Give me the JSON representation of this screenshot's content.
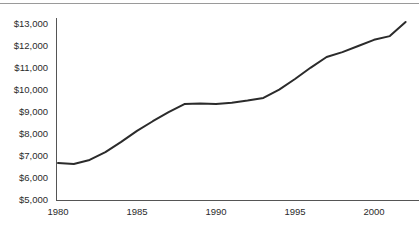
{
  "chart_data": {
    "type": "line",
    "title": "",
    "subtitle": "",
    "xlabel": "",
    "ylabel": "",
    "xlim": [
      1980,
      2002
    ],
    "ylim": [
      5000,
      13000
    ],
    "grid": false,
    "legend": null,
    "legend_position": "none",
    "y_tick_labels": [
      "$13,000",
      "$12,000",
      "$11,000",
      "$10,000",
      "$9,000",
      "$8,000",
      "$7,000",
      "$6,000",
      "$5,000"
    ],
    "y_tick_values": [
      13000,
      12000,
      11000,
      10000,
      9000,
      8000,
      7000,
      6000,
      5000
    ],
    "x_tick_labels": [
      "1980",
      "1985",
      "1990",
      "1995",
      "2000"
    ],
    "x_tick_values": [
      1980,
      1985,
      1990,
      1995,
      2000
    ],
    "series": [
      {
        "name": "value",
        "color": "#2b2b2b",
        "x": [
          1980,
          1981,
          1982,
          1983,
          1984,
          1985,
          1986,
          1987,
          1988,
          1989,
          1990,
          1991,
          1992,
          1993,
          1994,
          1995,
          1996,
          1997,
          1998,
          1999,
          2000,
          2001,
          2002
        ],
        "values": [
          6680,
          6640,
          6820,
          7180,
          7640,
          8140,
          8580,
          8990,
          9360,
          9390,
          9360,
          9420,
          9520,
          9640,
          10020,
          10500,
          11020,
          11500,
          11720,
          12000,
          12280,
          12450,
          13090
        ]
      }
    ]
  },
  "axis": {
    "line_color": "#555555",
    "tick_color": "#2b2b2b"
  },
  "decor": {
    "top_rule_color": "#9a9a9a"
  }
}
